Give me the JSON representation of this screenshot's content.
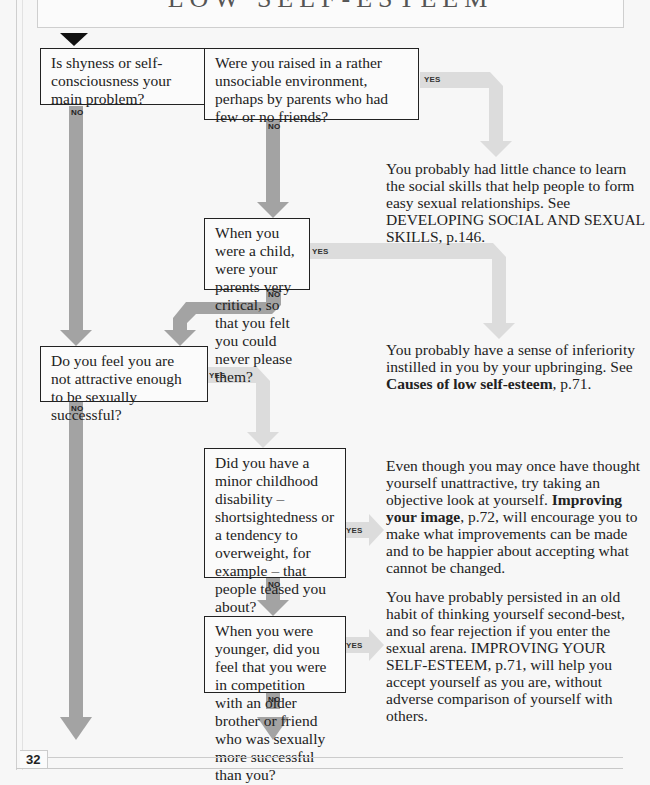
{
  "header": {
    "title": "LOW SELF-ESTEEM"
  },
  "page_number": "32",
  "labels": {
    "yes": "YES",
    "no": "NO"
  },
  "colors": {
    "yes_arrow": "#dcdcdc",
    "no_arrow": "#a3a3a3",
    "start_arrow": "#111111",
    "box_border": "#222222"
  },
  "questions": [
    {
      "id": "q1",
      "text": "Is shyness or self-consciousness your main problem?"
    },
    {
      "id": "q2",
      "text": "Were you raised in a rather unsociable environment, perhaps by parents who had few or no friends?"
    },
    {
      "id": "q3",
      "text": "When you were a child, were your parents very critical, so that you felt you could never please them?"
    },
    {
      "id": "q4",
      "text": "Do you feel you are not attractive enough to be sexually successful?"
    },
    {
      "id": "q5",
      "text": "Did you have a minor childhood disability – shortsightedness or a tendency to overweight, for example – that people teased you about?"
    },
    {
      "id": "q6",
      "text": "When you were younger, did you feel that you were in competition with an older brother or friend who was sexually more successful than you?"
    }
  ],
  "answers": [
    {
      "id": "a1",
      "text_before": "You probably had little chance to learn the social skills that help people to form easy sexual relationships. See DEVELOPING SOCIAL AND SEXUAL SKILLS, p.146.",
      "bold": "",
      "text_after": ""
    },
    {
      "id": "a2",
      "text_before": "You probably have a sense of inferiority instilled in you by your upbringing. See ",
      "bold": "Causes of low self-esteem",
      "text_after": ", p.71."
    },
    {
      "id": "a3",
      "text_before": "Even though you may once have thought yourself unattractive, try taking an objective look at yourself. ",
      "bold": "Improving your image",
      "text_after": ", p.72, will encourage you to make what improvements can be made and to be happier about accepting what cannot be changed."
    },
    {
      "id": "a4",
      "text_before": "You have probably persisted in an old habit of thinking yourself second-best, and so fear rejection if you enter the sexual arena. IMPROVING YOUR SELF-ESTEEM, p.71, will help you accept yourself as you are, without adverse comparison of yourself with others.",
      "bold": "",
      "text_after": ""
    }
  ]
}
